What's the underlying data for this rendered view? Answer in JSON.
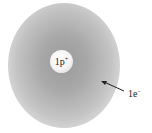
{
  "diagram": {
    "nucleus": {
      "label": "1p",
      "charge": "+"
    },
    "electron_cloud": {
      "label": "1e",
      "charge": "−"
    },
    "colors": {
      "cloud": "#a0a0a0",
      "nucleus": "#f4f4f4",
      "text": "#222222"
    }
  }
}
